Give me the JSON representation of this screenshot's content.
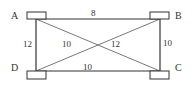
{
  "diagram": {
    "type": "weighted-graph",
    "nodes": [
      {
        "id": "A",
        "label": "A"
      },
      {
        "id": "B",
        "label": "B"
      },
      {
        "id": "C",
        "label": "C"
      },
      {
        "id": "D",
        "label": "D"
      }
    ],
    "edges": [
      {
        "from": "A",
        "to": "B",
        "weight": "8"
      },
      {
        "from": "A",
        "to": "D",
        "weight": "12"
      },
      {
        "from": "A",
        "to": "C",
        "weight": "10"
      },
      {
        "from": "B",
        "to": "D",
        "weight": "12"
      },
      {
        "from": "B",
        "to": "C",
        "weight": "10"
      },
      {
        "from": "D",
        "to": "C",
        "weight": "10"
      }
    ],
    "colors": {
      "line": "#333333",
      "background": "#ffffff"
    }
  }
}
